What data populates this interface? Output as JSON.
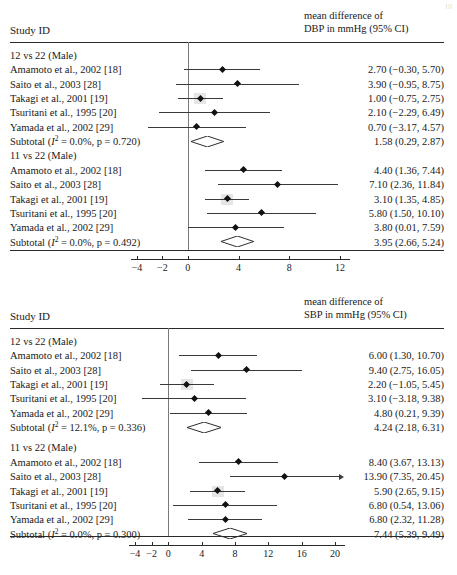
{
  "page_corner": "|||",
  "chart_data": [
    {
      "type": "forest",
      "panel_id": "dbp",
      "title": "",
      "column_headers": {
        "left": "Study ID",
        "right_line1": "mean difference of",
        "right_line2": "DBP in mmHg (95% CI)"
      },
      "xlabel": "",
      "ylabel": "",
      "xlim": [
        -5.2,
        13.6
      ],
      "xticks": [
        -4,
        -2,
        0,
        4,
        8,
        12
      ],
      "xtick_labels": [
        "-4",
        "-2",
        "0",
        "4",
        "8",
        "12"
      ],
      "null_line": 0,
      "grid": false,
      "groups": [
        {
          "label": "12 vs 22 (Male)",
          "rows": [
            {
              "study": "Amamoto et al., 2002 [18]",
              "estimate": 2.7,
              "lower": -0.3,
              "upper": 5.7,
              "text": "2.70 (−0.30, 5.70)",
              "weight_box": false
            },
            {
              "study": "Saito et al., 2003 [28]",
              "estimate": 3.9,
              "lower": -0.95,
              "upper": 8.75,
              "text": "3.90 (−0.95, 8.75)",
              "weight_box": false
            },
            {
              "study": "Takagi et al., 2001 [19]",
              "estimate": 1.0,
              "lower": -0.75,
              "upper": 2.75,
              "text": "1.00 (−0.75, 2.75)",
              "weight_box": true
            },
            {
              "study": "Tsuritani et al., 1995 [20]",
              "estimate": 2.1,
              "lower": -2.29,
              "upper": 6.49,
              "text": "2.10 (−2.29, 6.49)",
              "weight_box": false
            },
            {
              "study": "Yamada et al., 2002 [29]",
              "estimate": 0.7,
              "lower": -3.17,
              "upper": 4.57,
              "text": "0.70 (−3.17, 4.57)",
              "weight_box": false
            }
          ],
          "subtotal": {
            "label_pre": "Subtotal (",
            "label_i2": "I",
            "label_sup": "2",
            "label_post": " = 0.0%, p = 0.720)",
            "estimate": 1.58,
            "lower": 0.29,
            "upper": 2.87,
            "text": "1.58 (0.29, 2.87)",
            "i_squared": "0.0%",
            "p_value": "0.720"
          }
        },
        {
          "label": "11 vs 22 (Male)",
          "rows": [
            {
              "study": "Amamoto et al., 2002 [18]",
              "estimate": 4.4,
              "lower": 1.36,
              "upper": 7.44,
              "text": "4.40 (1.36, 7.44)",
              "weight_box": false
            },
            {
              "study": "Saito et al., 2003 [28]",
              "estimate": 7.1,
              "lower": 2.36,
              "upper": 11.84,
              "text": "7.10 (2.36, 11.84)",
              "weight_box": false
            },
            {
              "study": "Takagi et al., 2001 [19]",
              "estimate": 3.1,
              "lower": 1.35,
              "upper": 4.85,
              "text": "3.10 (1.35, 4.85)",
              "weight_box": true
            },
            {
              "study": "Tsuritani et al., 1995 [20]",
              "estimate": 5.8,
              "lower": 1.5,
              "upper": 10.1,
              "text": "5.80 (1.50, 10.10)",
              "weight_box": false
            },
            {
              "study": "Yamada et al., 2002 [29]",
              "estimate": 3.8,
              "lower": 0.01,
              "upper": 7.59,
              "text": "3.80 (0.01, 7.59)",
              "weight_box": false
            }
          ],
          "subtotal": {
            "label_pre": "Subtotal (",
            "label_i2": "I",
            "label_sup": "2",
            "label_post": " = 0.0%, p = 0.492)",
            "estimate": 3.95,
            "lower": 2.66,
            "upper": 5.24,
            "text": "3.95 (2.66, 5.24)",
            "i_squared": "0.0%",
            "p_value": "0.492"
          }
        }
      ]
    },
    {
      "type": "forest",
      "panel_id": "sbp",
      "title": "",
      "column_headers": {
        "left": "Study ID",
        "right_line1": "mean difference of",
        "right_line2": "SBP in mmHg (95% CI)"
      },
      "xlabel": "",
      "ylabel": "",
      "xlim": [
        -5.4,
        21.8
      ],
      "xticks": [
        -4,
        -2,
        0,
        4,
        8,
        12,
        16,
        20
      ],
      "xtick_labels": [
        "-4",
        "-2",
        "0",
        "4",
        "8",
        "12",
        "16",
        "20"
      ],
      "null_line": 0,
      "grid": false,
      "groups": [
        {
          "label": "12 vs 22 (Male)",
          "rows": [
            {
              "study": "Amamoto et al., 2002 [18]",
              "estimate": 6.0,
              "lower": 1.3,
              "upper": 10.7,
              "text": "6.00 (1.30, 10.70)",
              "weight_box": false
            },
            {
              "study": "Saito et al., 2003 [28]",
              "estimate": 9.4,
              "lower": 2.75,
              "upper": 16.05,
              "text": "9.40 (2.75, 16.05)",
              "weight_box": false
            },
            {
              "study": "Takagi et al., 2001 [19]",
              "estimate": 2.2,
              "lower": -1.05,
              "upper": 5.45,
              "text": "2.20 (−1.05, 5.45)",
              "weight_box": true
            },
            {
              "study": "Tsuritani et al., 1995 [20]",
              "estimate": 3.1,
              "lower": -3.18,
              "upper": 9.38,
              "text": "3.10 (−3.18, 9.38)",
              "weight_box": false
            },
            {
              "study": "Yamada et al., 2002 [29]",
              "estimate": 4.8,
              "lower": 0.21,
              "upper": 9.39,
              "text": "4.80 (0.21, 9.39)",
              "weight_box": false
            }
          ],
          "subtotal": {
            "label_pre": "Subtotal (",
            "label_i2": "I",
            "label_sup": "2",
            "label_post": " = 12.1%, p = 0.336)",
            "estimate": 4.24,
            "lower": 2.18,
            "upper": 6.31,
            "text": "4.24 (2.18, 6.31)",
            "i_squared": "12.1%",
            "p_value": "0.336"
          }
        },
        {
          "label": "11 vs 22 (Male)",
          "rows": [
            {
              "study": "Amamoto et al., 2002 [18]",
              "estimate": 8.4,
              "lower": 3.67,
              "upper": 13.13,
              "text": "8.40 (3.67, 13.13)",
              "weight_box": false
            },
            {
              "study": "Saito et al., 2003 [28]",
              "estimate": 13.9,
              "lower": 7.35,
              "upper": 20.45,
              "text": "13.90 (7.35, 20.45)",
              "weight_box": false,
              "clipped_right": true
            },
            {
              "study": "Takagi et al., 2001 [19]",
              "estimate": 5.9,
              "lower": 2.65,
              "upper": 9.15,
              "text": "5.90 (2.65, 9.15)",
              "weight_box": true
            },
            {
              "study": "Tsuritani et al., 1995 [20]",
              "estimate": 6.8,
              "lower": 0.54,
              "upper": 13.06,
              "text": "6.80 (0.54, 13.06)",
              "weight_box": false
            },
            {
              "study": "Yamada et al., 2002 [29]",
              "estimate": 6.8,
              "lower": 2.32,
              "upper": 11.28,
              "text": "6.80 (2.32, 11.28)",
              "weight_box": false
            }
          ],
          "subtotal": {
            "label_pre": "Subtotal (",
            "label_i2": "I",
            "label_sup": "2",
            "label_post": " = 0.0%, p = 0.300)",
            "estimate": 7.44,
            "lower": 5.39,
            "upper": 9.49,
            "text": "7.44 (5.39, 9.49)",
            "i_squared": "0.0%",
            "p_value": "0.300"
          }
        }
      ]
    }
  ]
}
